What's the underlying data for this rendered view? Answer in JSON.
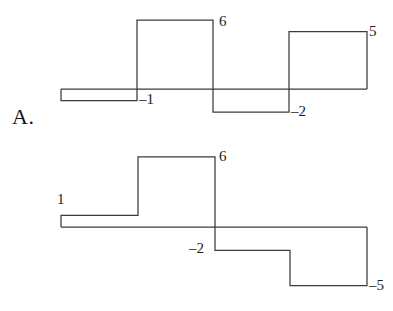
{
  "figure": {
    "background_color": "#ffffff",
    "stroke_color": "#3b3b3b",
    "text_color": "#1a1a1a"
  },
  "panels": [
    {
      "id": "A",
      "label": "A.",
      "label_x": 12,
      "label_y": 106,
      "baseline_y": 89,
      "unit_px": 11.5,
      "x_start": 61,
      "x_end": 367,
      "value_labels": [
        {
          "name": "label-6",
          "text": "6",
          "x": 219,
          "y": 14
        },
        {
          "name": "label-neg1",
          "text": "–1",
          "x": 139,
          "y": 92
        },
        {
          "name": "label-neg2",
          "text": "–2",
          "x": 291,
          "y": 104
        },
        {
          "name": "label-5",
          "text": "5",
          "x": 369,
          "y": 24
        }
      ]
    },
    {
      "id": "C",
      "label": "C.",
      "label_x": 12,
      "label_y": 266,
      "baseline_y": 227,
      "unit_px": 11.7,
      "x_start": 61,
      "x_end": 367,
      "value_labels": [
        {
          "name": "label-1",
          "text": "1",
          "x": 57,
          "y": 192
        },
        {
          "name": "label-6",
          "text": "6",
          "x": 219,
          "y": 149
        },
        {
          "name": "label-neg2",
          "text": "–2",
          "x": 189,
          "y": 241
        },
        {
          "name": "label-neg5",
          "text": "–5",
          "x": 369,
          "y": 278
        }
      ]
    }
  ],
  "chart_data": [
    {
      "type": "bar",
      "title": "A.",
      "chart_id": "A",
      "xlabel": "",
      "ylabel": "",
      "grid": false,
      "legend": "none",
      "ylim": [
        -2,
        6
      ],
      "baseline": 0,
      "categories": [
        "1",
        "2",
        "3",
        "4"
      ],
      "values": [
        -1,
        6,
        -2,
        5
      ],
      "annotations": [
        "6",
        "–1",
        "–2",
        "5"
      ],
      "segments": [
        {
          "x0": 61,
          "x1": 137,
          "value": -1,
          "label": "–1"
        },
        {
          "x0": 137,
          "x1": 213,
          "value": 6,
          "label": "6"
        },
        {
          "x0": 213,
          "x1": 289,
          "value": -2,
          "label": "–2"
        },
        {
          "x0": 289,
          "x1": 367,
          "value": 5,
          "label": "5"
        }
      ]
    },
    {
      "type": "bar",
      "title": "C.",
      "chart_id": "C",
      "xlabel": "",
      "ylabel": "",
      "grid": false,
      "legend": "none",
      "ylim": [
        -5,
        6
      ],
      "baseline": 0,
      "categories": [
        "1",
        "2",
        "3",
        "4"
      ],
      "values": [
        1,
        6,
        -2,
        -5
      ],
      "annotations": [
        "1",
        "6",
        "–2",
        "–5"
      ],
      "segments": [
        {
          "x0": 61,
          "x1": 138,
          "value": 1,
          "label": "1"
        },
        {
          "x0": 138,
          "x1": 215,
          "value": 6,
          "label": "6"
        },
        {
          "x0": 215,
          "x1": 290,
          "value": -2,
          "label": "–2"
        },
        {
          "x0": 290,
          "x1": 367,
          "value": -5,
          "label": "–5"
        }
      ]
    }
  ]
}
